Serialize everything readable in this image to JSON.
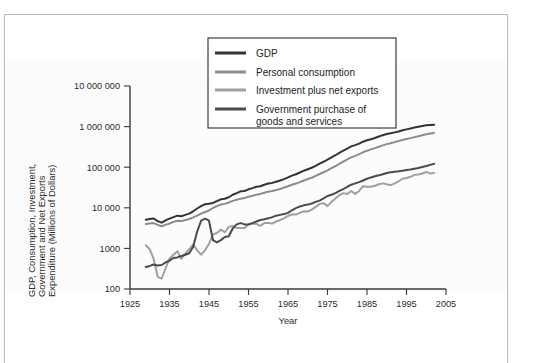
{
  "chart_data": {
    "type": "line",
    "title": "",
    "xlabel": "Year",
    "ylabel": "GDP, Consumption, Investment, Government and Net Exports Expenditure (Millions of Dollars)",
    "ylabel_lines": [
      "GDP, Consumption, Investment,",
      "Government and Net Exports",
      "Expenditure (Millions of Dollars)"
    ],
    "yscale": "log",
    "ylim": [
      100,
      10000000
    ],
    "xlim": [
      1925,
      2005
    ],
    "grid": false,
    "legend_position": "top-center",
    "xticks": [
      1925,
      1935,
      1945,
      1955,
      1965,
      1975,
      1985,
      1995,
      2005
    ],
    "xtick_labels": [
      "1925",
      "1935",
      "1945",
      "1955",
      "1965",
      "1975",
      "1985",
      "1995",
      "2005"
    ],
    "yticks": [
      100,
      1000,
      10000,
      100000,
      1000000,
      10000000
    ],
    "ytick_labels": [
      "100",
      "1000",
      "10 000",
      "100 000",
      "1 000 000",
      "10 000 000"
    ],
    "x": [
      1929,
      1930,
      1931,
      1932,
      1933,
      1934,
      1935,
      1936,
      1937,
      1938,
      1939,
      1940,
      1941,
      1942,
      1943,
      1944,
      1945,
      1946,
      1947,
      1948,
      1949,
      1950,
      1951,
      1952,
      1953,
      1954,
      1955,
      1956,
      1957,
      1958,
      1959,
      1960,
      1961,
      1962,
      1963,
      1964,
      1965,
      1966,
      1967,
      1968,
      1969,
      1970,
      1971,
      1972,
      1973,
      1974,
      1975,
      1976,
      1977,
      1978,
      1979,
      1980,
      1981,
      1982,
      1983,
      1984,
      1985,
      1986,
      1987,
      1988,
      1989,
      1990,
      1991,
      1992,
      1993,
      1994,
      1995,
      1996,
      1997,
      1998,
      1999,
      2000,
      2001,
      2002
    ],
    "series": [
      {
        "name": "GDP",
        "color": "#333333",
        "values": [
          5100,
          5300,
          5450,
          4700,
          4300,
          4900,
          5400,
          5900,
          6400,
          6200,
          6700,
          7200,
          8200,
          9600,
          11000,
          12300,
          12600,
          13200,
          14600,
          16200,
          16700,
          18200,
          21000,
          23000,
          25500,
          26000,
          28500,
          30500,
          33000,
          34000,
          37000,
          39500,
          41000,
          44000,
          47000,
          51000,
          56000,
          62000,
          67000,
          74000,
          82000,
          89000,
          97000,
          108000,
          123000,
          136000,
          153000,
          174000,
          197000,
          225000,
          255000,
          288000,
          325000,
          350000,
          380000,
          425000,
          460000,
          490000,
          525000,
          570000,
          615000,
          655000,
          685000,
          720000,
          760000,
          810000,
          855000,
          900000,
          950000,
          990000,
          1030000,
          1080000,
          1100000,
          1110000
        ]
      },
      {
        "name": "Personal consumption",
        "color": "#8c8c8c",
        "values": [
          4000,
          4100,
          4200,
          3800,
          3500,
          3800,
          4100,
          4500,
          4800,
          4700,
          5000,
          5300,
          5800,
          6400,
          7200,
          7900,
          8600,
          9900,
          11000,
          12000,
          12500,
          13500,
          14800,
          15800,
          16800,
          17500,
          18800,
          19800,
          21000,
          22000,
          23500,
          25000,
          26000,
          27500,
          29000,
          31500,
          34000,
          37000,
          39500,
          43000,
          47000,
          51000,
          55000,
          61000,
          68000,
          75000,
          84000,
          95000,
          107000,
          121000,
          138000,
          156000,
          175000,
          190000,
          210000,
          233000,
          255000,
          275000,
          295000,
          320000,
          345000,
          370000,
          390000,
          415000,
          440000,
          470000,
          495000,
          520000,
          550000,
          580000,
          615000,
          650000,
          680000,
          700000
        ]
      },
      {
        "name": "Investment plus net exports",
        "color": "#a0a0a0",
        "values": [
          1200,
          950,
          550,
          200,
          180,
          320,
          560,
          700,
          850,
          550,
          750,
          950,
          1250,
          900,
          700,
          900,
          1300,
          2200,
          2400,
          2900,
          2500,
          3400,
          3500,
          3200,
          3200,
          3200,
          3900,
          4100,
          4000,
          3600,
          4200,
          4200,
          4100,
          4600,
          5000,
          5500,
          6300,
          6900,
          6800,
          7500,
          8200,
          8100,
          9000,
          10500,
          12500,
          13000,
          11000,
          14000,
          17000,
          20500,
          23000,
          22000,
          26000,
          22000,
          26000,
          34000,
          33000,
          33000,
          35000,
          38000,
          40000,
          38000,
          36000,
          40000,
          45000,
          52000,
          54000,
          58000,
          65000,
          66000,
          70000,
          77000,
          70000,
          72000
        ]
      },
      {
        "name": "Government purchase of goods and services",
        "color": "#4a4a4a",
        "values": [
          350,
          370,
          400,
          380,
          390,
          450,
          500,
          580,
          600,
          650,
          700,
          760,
          1100,
          2600,
          4800,
          5400,
          4800,
          1600,
          1400,
          1600,
          1900,
          2000,
          3100,
          3900,
          4200,
          3900,
          3900,
          4200,
          4600,
          5000,
          5200,
          5500,
          5900,
          6400,
          6700,
          7000,
          7500,
          8700,
          9800,
          10800,
          11500,
          12000,
          12800,
          14000,
          15000,
          17000,
          19500,
          21000,
          23000,
          26000,
          29000,
          33000,
          37000,
          40000,
          43000,
          47000,
          52000,
          56000,
          60000,
          63000,
          67000,
          72000,
          75000,
          77000,
          79000,
          82000,
          85000,
          88000,
          92000,
          96000,
          101000,
          107000,
          114000,
          122000
        ]
      }
    ]
  },
  "legend": {
    "entries": [
      {
        "label": "GDP",
        "color": "#333333"
      },
      {
        "label": "Personal consumption",
        "color": "#8c8c8c"
      },
      {
        "label": "Investment plus net exports",
        "color": "#a0a0a0"
      },
      {
        "label": "Government purchase of",
        "label2": "goods and services",
        "color": "#4a4a4a"
      }
    ]
  }
}
